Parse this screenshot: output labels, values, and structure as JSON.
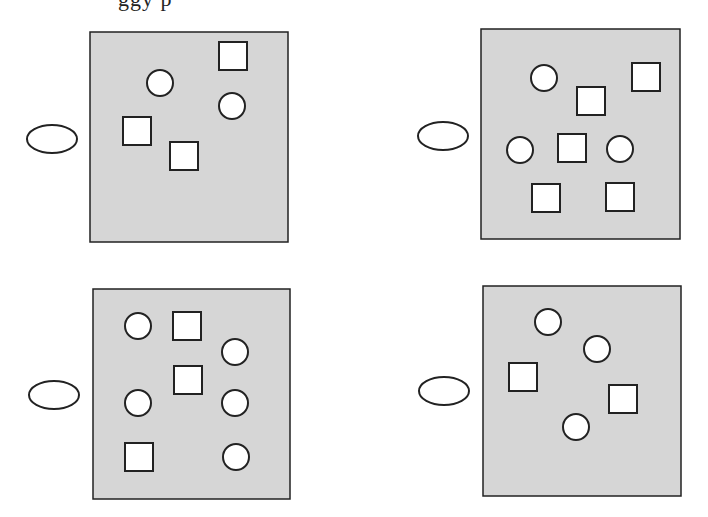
{
  "header": {
    "text_fragment": "ggy p",
    "note": "partially cut off at top edge"
  },
  "colors": {
    "panel_fill": "#d6d6d6",
    "stroke": "#222222",
    "shape_fill": "#ffffff",
    "background": "#ffffff"
  },
  "panels": [
    {
      "id": "top-left",
      "box": {
        "x": 90,
        "y": 32,
        "w": 198,
        "h": 210
      },
      "ellipse": {
        "cx": 52,
        "cy": 139,
        "rx": 25,
        "ry": 14
      },
      "shapes": [
        {
          "type": "circle",
          "cx": 160,
          "cy": 83,
          "r": 13
        },
        {
          "type": "square",
          "x": 219,
          "y": 42,
          "s": 28
        },
        {
          "type": "circle",
          "cx": 232,
          "cy": 106,
          "r": 13
        },
        {
          "type": "square",
          "x": 123,
          "y": 117,
          "s": 28
        },
        {
          "type": "square",
          "x": 170,
          "y": 142,
          "s": 28
        }
      ],
      "counts": {
        "circles": 2,
        "squares": 3
      }
    },
    {
      "id": "top-right",
      "box": {
        "x": 481,
        "y": 29,
        "w": 199,
        "h": 210
      },
      "ellipse": {
        "cx": 443,
        "cy": 136,
        "rx": 25,
        "ry": 14
      },
      "shapes": [
        {
          "type": "circle",
          "cx": 544,
          "cy": 78,
          "r": 13
        },
        {
          "type": "square",
          "x": 577,
          "y": 87,
          "s": 28
        },
        {
          "type": "square",
          "x": 632,
          "y": 63,
          "s": 28
        },
        {
          "type": "circle",
          "cx": 520,
          "cy": 150,
          "r": 13
        },
        {
          "type": "square",
          "x": 558,
          "y": 134,
          "s": 28
        },
        {
          "type": "circle",
          "cx": 620,
          "cy": 149,
          "r": 13
        },
        {
          "type": "square",
          "x": 532,
          "y": 184,
          "s": 28
        },
        {
          "type": "square",
          "x": 606,
          "y": 183,
          "s": 28
        }
      ],
      "counts": {
        "circles": 3,
        "squares": 5
      }
    },
    {
      "id": "bottom-left",
      "box": {
        "x": 93,
        "y": 289,
        "w": 197,
        "h": 210
      },
      "ellipse": {
        "cx": 54,
        "cy": 395,
        "rx": 25,
        "ry": 14
      },
      "shapes": [
        {
          "type": "circle",
          "cx": 138,
          "cy": 326,
          "r": 13
        },
        {
          "type": "square",
          "x": 173,
          "y": 312,
          "s": 28
        },
        {
          "type": "circle",
          "cx": 235,
          "cy": 352,
          "r": 13
        },
        {
          "type": "square",
          "x": 174,
          "y": 366,
          "s": 28
        },
        {
          "type": "circle",
          "cx": 138,
          "cy": 403,
          "r": 13
        },
        {
          "type": "circle",
          "cx": 235,
          "cy": 403,
          "r": 13
        },
        {
          "type": "square",
          "x": 125,
          "y": 443,
          "s": 28
        },
        {
          "type": "circle",
          "cx": 236,
          "cy": 457,
          "r": 13
        }
      ],
      "counts": {
        "circles": 5,
        "squares": 3
      }
    },
    {
      "id": "bottom-right",
      "box": {
        "x": 483,
        "y": 286,
        "w": 198,
        "h": 210
      },
      "ellipse": {
        "cx": 444,
        "cy": 391,
        "rx": 25,
        "ry": 14
      },
      "shapes": [
        {
          "type": "circle",
          "cx": 548,
          "cy": 322,
          "r": 13
        },
        {
          "type": "circle",
          "cx": 597,
          "cy": 349,
          "r": 13
        },
        {
          "type": "square",
          "x": 509,
          "y": 363,
          "s": 28
        },
        {
          "type": "square",
          "x": 609,
          "y": 385,
          "s": 28
        },
        {
          "type": "circle",
          "cx": 576,
          "cy": 427,
          "r": 13
        }
      ],
      "counts": {
        "circles": 3,
        "squares": 2
      }
    }
  ]
}
